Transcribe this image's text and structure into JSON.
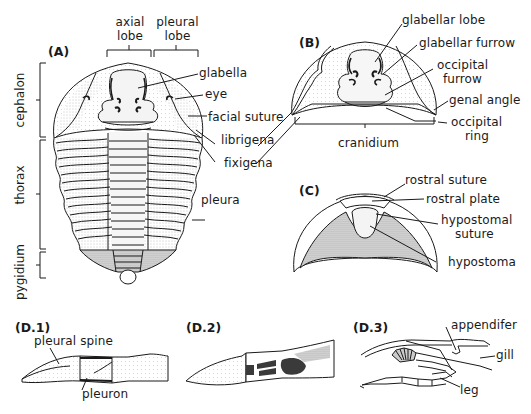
{
  "figure": {
    "colors": {
      "ink": "#1a1a1a",
      "stipple": "#b8b8b8",
      "background": "#ffffff",
      "dark_fill": "#3a3a3a"
    }
  },
  "panel_a": {
    "label": "(A)",
    "top_labels": {
      "axial_lobe": "axial\nlobe",
      "axial_lobe_line1": "axial",
      "axial_lobe_line2": "lobe",
      "pleural_lobe_line1": "pleural",
      "pleural_lobe_line2": "lobe"
    },
    "side_labels": {
      "cephalon": "cephalon",
      "thorax": "thorax",
      "pygidium": "pygidium"
    },
    "callouts": [
      "glabella",
      "eye",
      "facial suture",
      "librigena",
      "fixigena",
      "pleura"
    ]
  },
  "panel_b": {
    "label": "(B)",
    "callouts": {
      "glabellar_lobe": "glabellar lobe",
      "glabellar_furrow": "glabellar furrow",
      "occipital_furrow_line1": "occipital",
      "occipital_furrow_line2": "furrow",
      "genal_angle": "genal angle",
      "occipital_ring_line1": "occipital",
      "occipital_ring_line2": "ring"
    },
    "bracket_label": "cranidium"
  },
  "panel_c": {
    "label": "(C)",
    "callouts": {
      "rostral_suture": "rostral suture",
      "rostral_plate": "rostral plate",
      "hypostomal_suture_line1": "hypostomal",
      "hypostomal_suture_line2": "suture",
      "hypostoma": "hypostoma"
    }
  },
  "panel_d1": {
    "label": "(D.1)",
    "callouts": {
      "pleural_spine": "pleural spine",
      "pleuron": "pleuron"
    }
  },
  "panel_d2": {
    "label": "(D.2)"
  },
  "panel_d3": {
    "label": "(D.3)",
    "callouts": {
      "appendifer": "appendifer",
      "gill": "gill",
      "leg": "leg"
    }
  }
}
